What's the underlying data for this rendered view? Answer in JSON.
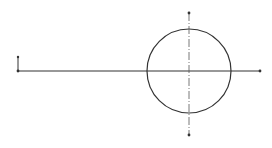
{
  "drawing": {
    "width": 272,
    "height": 148,
    "background": "#ffffff",
    "stroke_color": "#333333",
    "centerline_color": "#555555",
    "origin_marker": {
      "x": 18,
      "y": 71,
      "tick_top_y": 57
    },
    "horizontal_line": {
      "x1": 18,
      "y1": 71,
      "x2": 260,
      "y2": 71,
      "end_dot_x": 260
    },
    "circle": {
      "cx": 189,
      "cy": 71,
      "r": 42
    },
    "vertical_centerline": {
      "x": 189,
      "y1": 13,
      "y2": 135,
      "style": "dash-dot"
    }
  }
}
